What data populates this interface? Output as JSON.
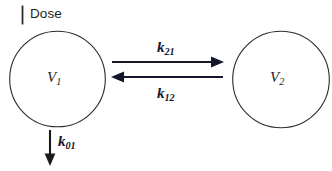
{
  "diagram": {
    "type": "two-compartment-pharmacokinetic-model",
    "background_color": "#ffffff",
    "stroke_color": "#2b2b2b",
    "arrow_color": "#16162a",
    "dose": {
      "label": "Dose",
      "tick_mark": "vertical-bar"
    },
    "compartments": [
      {
        "id": "central",
        "label_base": "V",
        "label_sub": "1",
        "label_full": "V1",
        "cx": 57.5,
        "cy": 79,
        "r": 48
      },
      {
        "id": "peripheral",
        "label_base": "V",
        "label_sub": "2",
        "label_full": "V2",
        "cx": 281,
        "cy": 79.5,
        "r": 48.5
      }
    ],
    "transfers": [
      {
        "id": "k21",
        "label_base": "k",
        "label_sub": "21",
        "label_full": "k21",
        "direction": "right",
        "from": "peripheral",
        "to": "central",
        "y": 62
      },
      {
        "id": "k12",
        "label_base": "k",
        "label_sub": "12",
        "label_full": "k12",
        "direction": "left",
        "from": "central",
        "to": "peripheral",
        "y": 77
      }
    ],
    "elimination": {
      "id": "k01",
      "label_base": "k",
      "label_sub": "01",
      "label_full": "k01",
      "direction": "down",
      "from": "central"
    }
  }
}
